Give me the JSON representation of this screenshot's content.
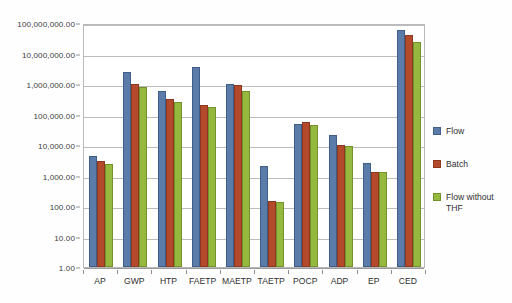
{
  "chart_data": {
    "type": "bar",
    "title": "",
    "subtitle": "",
    "xlabel": "",
    "ylabel": "",
    "yscale": "log",
    "ylim": [
      1,
      100000000
    ],
    "grid": true,
    "legend_position": "right",
    "ytick_labels": [
      "1.00",
      "10.00",
      "100.00",
      "1,000.00",
      "10,000.00",
      "100,000.00",
      "1,000,000.00",
      "10,000,000.00",
      "100,000,000.00"
    ],
    "ytick_values": [
      1,
      10,
      100,
      1000,
      10000,
      100000,
      1000000,
      10000000,
      100000000
    ],
    "categories": [
      "AP",
      "GWP",
      "HTP",
      "FAETP",
      "MAETP",
      "TAETP",
      "POCP",
      "ADP",
      "EP",
      "CED"
    ],
    "series": [
      {
        "name": "Flow",
        "color": "#5b7ba8",
        "values": [
          4500,
          2500000,
          600000,
          3500000,
          1000000,
          2000,
          50000,
          22000,
          2500,
          60000000
        ]
      },
      {
        "name": "Batch",
        "color": "#b34a2c",
        "values": [
          2900,
          1000000,
          330000,
          200000,
          900000,
          150,
          55000,
          10000,
          1300,
          40000000
        ]
      },
      {
        "name": "Flow without THF",
        "color": "#95b83f",
        "values": [
          2300,
          800000,
          250000,
          170000,
          600000,
          140,
          45000,
          9500,
          1300,
          23000000
        ]
      }
    ],
    "legend": [
      {
        "label": "Flow",
        "color": "#5b7ba8"
      },
      {
        "label": "Batch",
        "color": "#b34a2c"
      },
      {
        "label": "Flow without THF",
        "color": "#95b83f"
      }
    ]
  }
}
